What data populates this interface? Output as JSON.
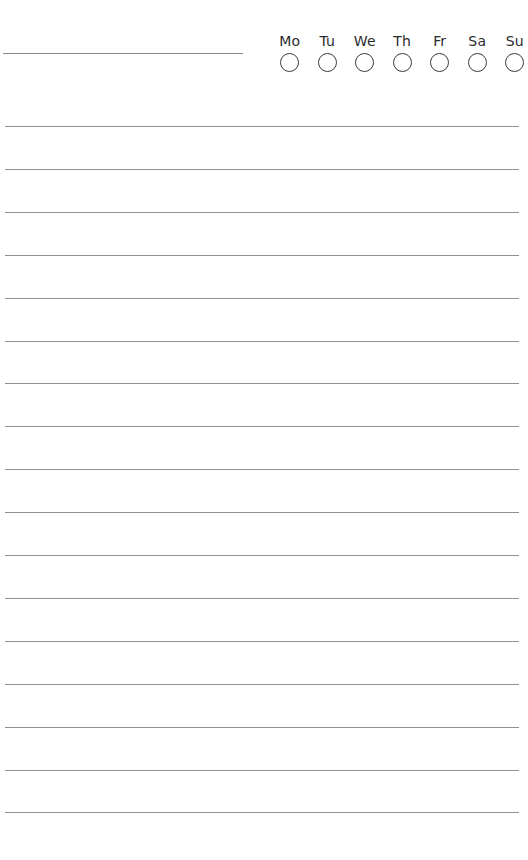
{
  "page": {
    "type": "habit-tracker-lined-page",
    "title_field_value": ""
  },
  "weekdays": [
    {
      "label": "Mo",
      "checked": false
    },
    {
      "label": "Tu",
      "checked": false
    },
    {
      "label": "We",
      "checked": false
    },
    {
      "label": "Th",
      "checked": false
    },
    {
      "label": "Fr",
      "checked": false
    },
    {
      "label": "Sa",
      "checked": false
    },
    {
      "label": "Su",
      "checked": false
    }
  ],
  "lines": {
    "count": 17,
    "spacing_px": 43,
    "color": "#8f8f8f"
  }
}
